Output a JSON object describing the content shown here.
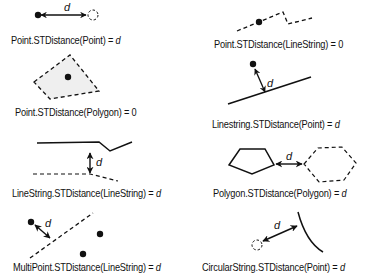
{
  "diagram": {
    "panels": [
      {
        "id": "point-point",
        "label_prefix": "Point.STDistance(Point) = ",
        "result": "d",
        "result_italic": true,
        "distance_symbol": "d"
      },
      {
        "id": "point-linestring",
        "label_prefix": "Point.STDistance(LineString) = ",
        "result": "0",
        "result_italic": false
      },
      {
        "id": "point-polygon",
        "label_prefix": "Point.STDistance(Polygon) = ",
        "result": "0",
        "result_italic": false
      },
      {
        "id": "linestring-point",
        "label_prefix": "Linestring.STDistance(Point) = ",
        "result": "d",
        "result_italic": true,
        "distance_symbol": "d"
      },
      {
        "id": "linestring-linestring",
        "label_prefix": "LineString.STDistance(LineString) = ",
        "result": "d",
        "result_italic": true,
        "distance_symbol": "d"
      },
      {
        "id": "polygon-polygon",
        "label_prefix": "Polygon.STDistance(Polygon) = ",
        "result": "d",
        "result_italic": true,
        "distance_symbol": "d"
      },
      {
        "id": "multipoint-linestring",
        "label_prefix": "MultiPoint.STDistance(LineString) = ",
        "result": "d",
        "result_italic": true,
        "distance_symbol": "d"
      },
      {
        "id": "circularstring-point",
        "label_prefix": "CircularString.STDistance(Point) = ",
        "result": "d",
        "result_italic": true,
        "distance_symbol": "d"
      }
    ],
    "colors": {
      "stroke": "#111111",
      "polygon_fill": "#eeeeee",
      "background": "#ffffff"
    }
  }
}
